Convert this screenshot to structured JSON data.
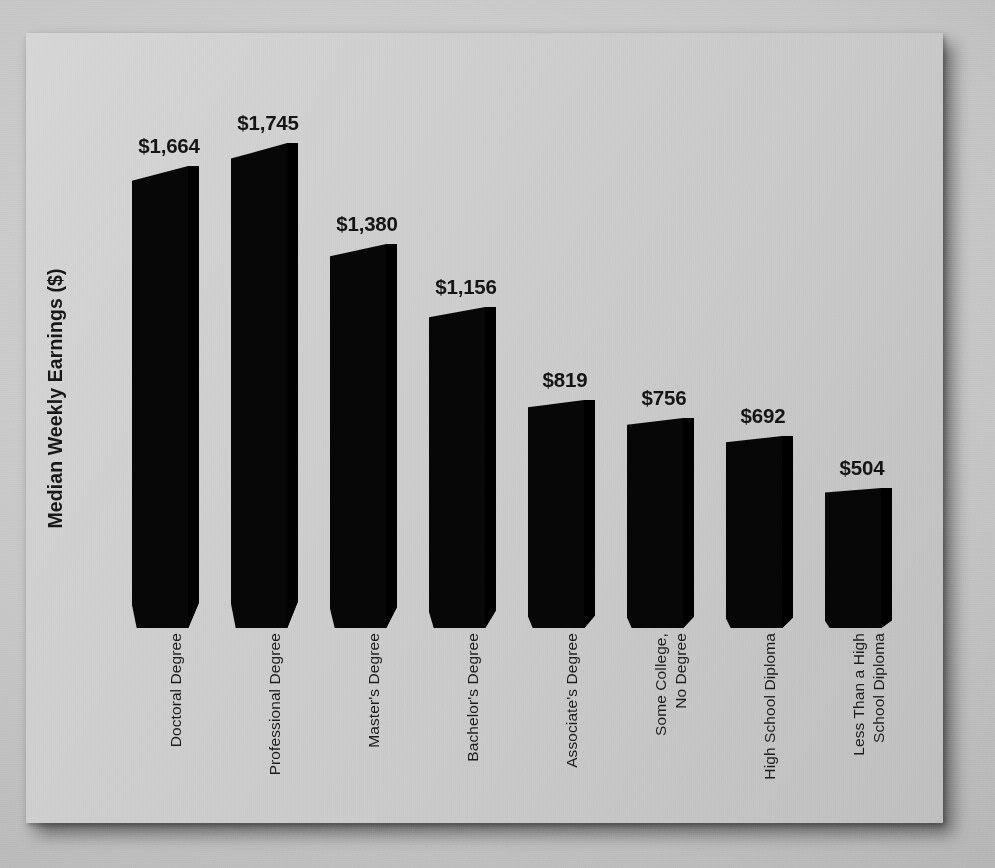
{
  "chart_data": {
    "type": "bar",
    "title": "",
    "xlabel": "",
    "ylabel": "Median Weekly Earnings ($)",
    "categories": [
      "Doctoral Degree",
      "Professional Degree",
      "Master's Degree",
      "Bachelor's Degree",
      "Associate's Degree",
      "Some College, No Degree",
      "High School Diploma",
      "Less Than a High School Diploma"
    ],
    "category_lines": [
      [
        "Doctoral Degree"
      ],
      [
        "Professional Degree"
      ],
      [
        "Master's Degree"
      ],
      [
        "Bachelor's Degree"
      ],
      [
        "Associate's Degree"
      ],
      [
        "Some College,",
        "No Degree"
      ],
      [
        "High School Diploma"
      ],
      [
        "Less Than a High",
        "School Diploma"
      ]
    ],
    "values": [
      1664,
      1745,
      1380,
      1156,
      819,
      756,
      692,
      504
    ],
    "value_labels": [
      "$1,664",
      "$1,745",
      "$1,380",
      "$1,156",
      "$819",
      "$756",
      "$692",
      "$504"
    ],
    "ylim": [
      0,
      1745
    ],
    "grid": false,
    "legend": false,
    "bar_color": "#060606",
    "background_color": "#cacaca",
    "text_color": "#171717"
  },
  "axes": {
    "y_title": "Median Weekly Earnings ($)"
  }
}
